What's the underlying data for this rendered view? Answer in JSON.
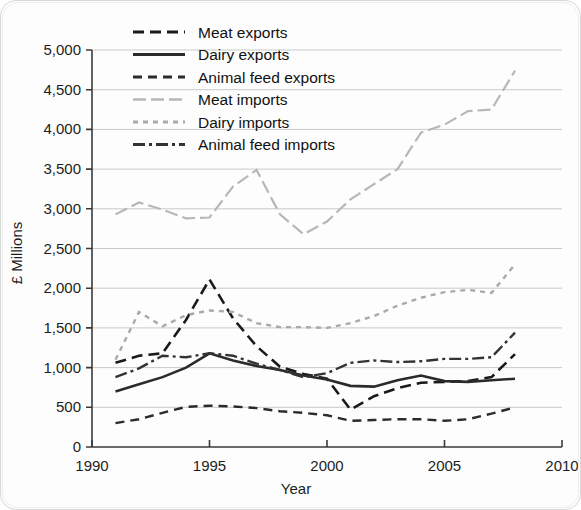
{
  "chart_data": {
    "type": "line",
    "title": "",
    "xlabel": "Year",
    "ylabel": "£ Millions",
    "xlim": [
      1990,
      2010
    ],
    "ylim": [
      0,
      5000
    ],
    "xticks": [
      1990,
      1995,
      2000,
      2005,
      2010
    ],
    "xtick_labels": [
      "1990",
      "1995",
      "2000",
      "2005",
      "2010"
    ],
    "yticks": [
      0,
      500,
      1000,
      1500,
      2000,
      2500,
      3000,
      3500,
      4000,
      4500,
      5000
    ],
    "ytick_labels": [
      "0",
      "500",
      "1,000",
      "1,500",
      "2,000",
      "2,500",
      "3,000",
      "3,500",
      "4,000",
      "4,500",
      "5,000"
    ],
    "grid": true,
    "grid_axis": "y",
    "legend_position": "top-left",
    "x": [
      1991,
      1992,
      1993,
      1994,
      1995,
      1996,
      1997,
      1998,
      1999,
      2000,
      2001,
      2002,
      2003,
      2004,
      2005,
      2006,
      2007,
      2008
    ],
    "series": [
      {
        "name": "Meat exports",
        "style": "dashed",
        "color": "#1a1a1a",
        "width": 2.6,
        "dash": "11,6",
        "values": [
          1060,
          1150,
          1180,
          1600,
          2110,
          1620,
          1270,
          1010,
          920,
          860,
          470,
          640,
          740,
          810,
          820,
          830,
          880,
          1170
        ]
      },
      {
        "name": "Dairy exports",
        "style": "solid",
        "color": "#2b2b2b",
        "width": 2.6,
        "dash": "none",
        "values": [
          700,
          790,
          880,
          1000,
          1180,
          1090,
          1020,
          970,
          900,
          850,
          770,
          760,
          840,
          900,
          830,
          820,
          840,
          860
        ]
      },
      {
        "name": "Animal feed exports",
        "style": "dashed-thin",
        "color": "#2b2b2b",
        "width": 2.4,
        "dash": "9,6",
        "values": [
          300,
          350,
          430,
          505,
          520,
          510,
          490,
          450,
          430,
          400,
          330,
          340,
          350,
          350,
          330,
          350,
          420,
          500
        ]
      },
      {
        "name": "Meat imports",
        "style": "long-dash-light",
        "color": "#b7b7b7",
        "width": 2.2,
        "dash": "13,5",
        "values": [
          2930,
          3080,
          2990,
          2880,
          2890,
          3280,
          3490,
          2930,
          2680,
          2840,
          3120,
          3310,
          3500,
          3960,
          4060,
          4230,
          4250,
          4740
        ]
      },
      {
        "name": "Dairy imports",
        "style": "dotted-light",
        "color": "#a9a9a9",
        "width": 2.4,
        "dash": "5,5",
        "values": [
          1100,
          1700,
          1520,
          1660,
          1720,
          1700,
          1560,
          1510,
          1510,
          1500,
          1560,
          1650,
          1780,
          1880,
          1950,
          1980,
          1940,
          2300
        ]
      },
      {
        "name": "Animal feed imports",
        "style": "dash-dot",
        "color": "#333333",
        "width": 2.4,
        "dash": "12,4,3,4",
        "values": [
          880,
          990,
          1150,
          1130,
          1180,
          1150,
          1050,
          970,
          880,
          930,
          1060,
          1090,
          1070,
          1080,
          1110,
          1110,
          1130,
          1440
        ]
      }
    ]
  },
  "legend": {
    "items": [
      {
        "label": "Meat exports"
      },
      {
        "label": "Dairy exports"
      },
      {
        "label": "Animal feed exports"
      },
      {
        "label": "Meat imports"
      },
      {
        "label": "Dairy imports"
      },
      {
        "label": "Animal feed imports"
      }
    ]
  }
}
